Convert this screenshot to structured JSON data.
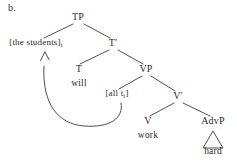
{
  "figure": {
    "panel_label": "b.",
    "stroke_color": "#3a3a3a",
    "text_color": "#2b2b2b",
    "background_color": "#ffffff"
  },
  "tree": {
    "nodes": [
      {
        "id": "tp",
        "label": "TP",
        "x": 78,
        "y": 20
      },
      {
        "id": "subject",
        "label": "[the students]",
        "sub": "i",
        "x": 36,
        "y": 46
      },
      {
        "id": "tbar",
        "label": "T",
        "prime": "′",
        "x": 113,
        "y": 46
      },
      {
        "id": "t",
        "label": "T",
        "x": 79,
        "y": 72
      },
      {
        "id": "will",
        "label": "will",
        "x": 79,
        "y": 87
      },
      {
        "id": "vp",
        "label": "VP",
        "x": 146,
        "y": 72
      },
      {
        "id": "alltrace",
        "label": "[all t",
        "sub": "i",
        "tail": "]",
        "x": 117,
        "y": 97
      },
      {
        "id": "vbar",
        "label": "V",
        "prime": "′",
        "x": 178,
        "y": 99
      },
      {
        "id": "v",
        "label": "V",
        "x": 148,
        "y": 124
      },
      {
        "id": "work",
        "label": "work",
        "x": 148,
        "y": 139
      },
      {
        "id": "advp",
        "label": "AdvP",
        "x": 213,
        "y": 124
      },
      {
        "id": "hard",
        "label": "hard",
        "x": 213,
        "y": 155
      }
    ],
    "branches": [
      {
        "from": "tp",
        "to": "subject",
        "x1": 73,
        "y1": 24,
        "x2": 44,
        "y2": 38
      },
      {
        "from": "tp",
        "to": "tbar",
        "x1": 84,
        "y1": 24,
        "x2": 110,
        "y2": 38
      },
      {
        "from": "tbar",
        "to": "t",
        "x1": 109,
        "y1": 50,
        "x2": 80,
        "y2": 64
      },
      {
        "from": "tbar",
        "to": "vp",
        "x1": 118,
        "y1": 50,
        "x2": 143,
        "y2": 64
      },
      {
        "from": "vp",
        "to": "alltrace",
        "x1": 142,
        "y1": 76,
        "x2": 119,
        "y2": 89
      },
      {
        "from": "vp",
        "to": "vbar",
        "x1": 151,
        "y1": 76,
        "x2": 175,
        "y2": 91
      },
      {
        "from": "vbar",
        "to": "v",
        "x1": 174,
        "y1": 103,
        "x2": 150,
        "y2": 116
      },
      {
        "from": "vbar",
        "to": "advp",
        "x1": 183,
        "y1": 103,
        "x2": 210,
        "y2": 116
      }
    ],
    "triangle": {
      "for": "hard",
      "apex_x": 213,
      "apex_y": 131,
      "left_x": 203,
      "left_y": 148,
      "right_x": 223,
      "right_y": 148
    },
    "movement_arrow": {
      "description": "movement arrow from [all t] to [the students] subscript",
      "path": "M 121 103 C 124 118, 110 128, 84 126 C 58 124, 42 104, 44 66",
      "arrow_tip_x": 45,
      "arrow_tip_y": 52
    }
  }
}
